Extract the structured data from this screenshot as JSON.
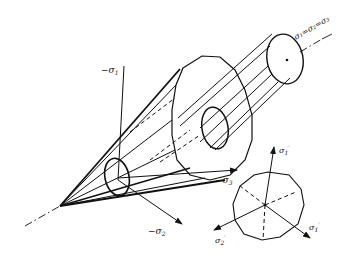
{
  "figure": {
    "hydrostatic_axis_label": "σ₁=σ₂=σ₃",
    "axes": {
      "neg_sigma1": {
        "prefix": "−σ",
        "sub": "1"
      },
      "neg_sigma2": {
        "prefix": "−σ",
        "sub": "2"
      },
      "neg_sigma3": {
        "prefix": "−σ",
        "sub": "3"
      }
    },
    "deviatoric_plane": {
      "sigma1_prime": {
        "base": "σ",
        "sub": "1",
        "prime": "′"
      },
      "sigma2_prime": {
        "base": "σ",
        "sub": "2",
        "prime": "′"
      },
      "sigma3_prime": {
        "base": "σ",
        "sub": "1",
        "prime": "′"
      }
    },
    "colors": {
      "ink": "#111111",
      "background": "#ffffff"
    }
  }
}
